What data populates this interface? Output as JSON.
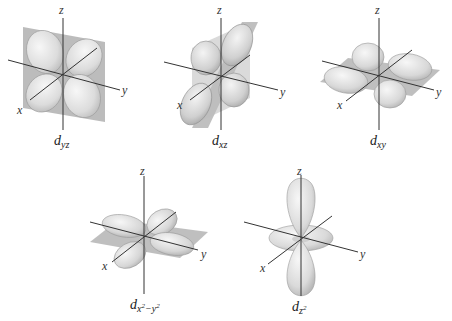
{
  "figure": {
    "colors": {
      "plane": "#a9a9a9",
      "lobe_light": "#f2f2f2",
      "lobe_dark": "#c4c4c4",
      "axis": "#333333",
      "text": "#222222"
    },
    "axis_labels": {
      "x": "x",
      "y": "y",
      "z": "z"
    },
    "orbitals": [
      {
        "id": "dyz",
        "symbol": "d",
        "subscript": "yz",
        "plane": "yz",
        "lobe_direction": "between y and z axes"
      },
      {
        "id": "dxz",
        "symbol": "d",
        "subscript": "xz",
        "plane": "xz",
        "lobe_direction": "between x and z axes"
      },
      {
        "id": "dxy",
        "symbol": "d",
        "subscript": "xy",
        "plane": "xy",
        "lobe_direction": "between x and y axes"
      },
      {
        "id": "dx2y2",
        "symbol": "d",
        "subscript_base1": "x",
        "sup1": "2",
        "minus": "−",
        "subscript_base2": "y",
        "sup2": "2",
        "plane": "xy",
        "lobe_direction": "along x and y axes"
      },
      {
        "id": "dz2",
        "symbol": "d",
        "subscript_base": "z",
        "sup": "2",
        "plane": "none",
        "lobe_direction": "along z axis with torus in xy plane"
      }
    ]
  }
}
